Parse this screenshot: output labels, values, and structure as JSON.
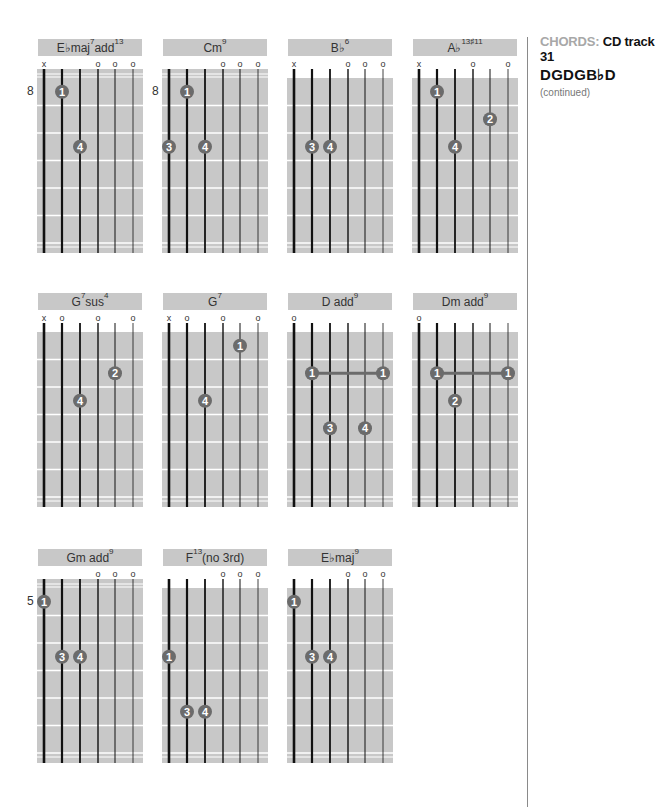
{
  "sidebar": {
    "category_label": "CHORDS:",
    "track_label": "CD track 31",
    "tuning": "DGDGB♭D",
    "note": "(continued)"
  },
  "colors": {
    "grid_bg": "#c8c8c8",
    "title_bg": "#c8c8c8",
    "finger_dot": "#6b6b6b",
    "barre": "#6b6b6b",
    "fret_line": "#ffffff",
    "string": "#111111"
  },
  "chords": [
    {
      "name": "E♭maj",
      "sup1": "7",
      "mid": "add",
      "sup2": "13",
      "x": 37,
      "y": 39,
      "open_top": false,
      "fret_number": "8",
      "marks": [
        "x",
        "",
        "",
        "o",
        "o",
        "o"
      ],
      "fingers": [
        {
          "string": 2,
          "fret": 1,
          "label": "1"
        },
        {
          "string": 3,
          "fret": 3,
          "label": "4"
        }
      ],
      "barre": null
    },
    {
      "name": "Cm",
      "sup1": "9",
      "mid": "",
      "sup2": "",
      "x": 162,
      "y": 39,
      "open_top": false,
      "fret_number": "8",
      "marks": [
        "",
        "",
        "",
        "o",
        "o",
        "o"
      ],
      "fingers": [
        {
          "string": 2,
          "fret": 1,
          "label": "1"
        },
        {
          "string": 1,
          "fret": 3,
          "label": "3"
        },
        {
          "string": 3,
          "fret": 3,
          "label": "4"
        }
      ],
      "barre": null
    },
    {
      "name": "B♭",
      "sup1": "6",
      "mid": "",
      "sup2": "",
      "x": 287,
      "y": 39,
      "open_top": true,
      "fret_number": "",
      "marks": [
        "x",
        "",
        "",
        "o",
        "o",
        "o"
      ],
      "fingers": [
        {
          "string": 2,
          "fret": 3,
          "label": "3"
        },
        {
          "string": 3,
          "fret": 3,
          "label": "4"
        }
      ],
      "barre": null
    },
    {
      "name": "A♭",
      "sup1": "13♯11",
      "mid": "",
      "sup2": "",
      "x": 412,
      "y": 39,
      "open_top": true,
      "fret_number": "",
      "marks": [
        "x",
        "",
        "",
        "o",
        "",
        "o"
      ],
      "fingers": [
        {
          "string": 2,
          "fret": 1,
          "label": "1"
        },
        {
          "string": 5,
          "fret": 2,
          "label": "2"
        },
        {
          "string": 3,
          "fret": 3,
          "label": "4"
        }
      ],
      "barre": null
    },
    {
      "name": "G",
      "sup1": "7",
      "mid": "sus",
      "sup2": "4",
      "x": 37,
      "y": 293,
      "open_top": true,
      "fret_number": "",
      "marks": [
        "x",
        "o",
        "",
        "o",
        "",
        "o"
      ],
      "fingers": [
        {
          "string": 5,
          "fret": 2,
          "label": "2"
        },
        {
          "string": 3,
          "fret": 3,
          "label": "4"
        }
      ],
      "barre": null
    },
    {
      "name": "G",
      "sup1": "7",
      "mid": "",
      "sup2": "",
      "x": 162,
      "y": 293,
      "open_top": true,
      "fret_number": "",
      "marks": [
        "x",
        "o",
        "",
        "o",
        "",
        "o"
      ],
      "fingers": [
        {
          "string": 5,
          "fret": 1,
          "label": "1"
        },
        {
          "string": 3,
          "fret": 3,
          "label": "4"
        }
      ],
      "barre": null
    },
    {
      "name": "D add",
      "sup1": "9",
      "mid": "",
      "sup2": "",
      "x": 287,
      "y": 293,
      "open_top": true,
      "fret_number": "",
      "marks": [
        "o",
        "",
        "",
        "",
        "",
        ""
      ],
      "fingers": [
        {
          "string": 3,
          "fret": 4,
          "label": "3"
        },
        {
          "string": 5,
          "fret": 4,
          "label": "4"
        }
      ],
      "barre": {
        "fret": 2,
        "from": 2,
        "to": 6,
        "label": "1"
      }
    },
    {
      "name": "Dm add",
      "sup1": "9",
      "mid": "",
      "sup2": "",
      "x": 412,
      "y": 293,
      "open_top": true,
      "fret_number": "",
      "marks": [
        "o",
        "",
        "",
        "",
        "",
        ""
      ],
      "fingers": [
        {
          "string": 3,
          "fret": 3,
          "label": "2"
        }
      ],
      "barre": {
        "fret": 2,
        "from": 2,
        "to": 6,
        "label": "1"
      }
    },
    {
      "name": "Gm add",
      "sup1": "9",
      "mid": "",
      "sup2": "",
      "x": 37,
      "y": 549,
      "open_top": false,
      "fret_number": "5",
      "marks": [
        "",
        "",
        "",
        "o",
        "o",
        "o"
      ],
      "fingers": [
        {
          "string": 1,
          "fret": 1,
          "label": "1"
        },
        {
          "string": 2,
          "fret": 3,
          "label": "3"
        },
        {
          "string": 3,
          "fret": 3,
          "label": "4"
        }
      ],
      "barre": null
    },
    {
      "name": "F",
      "sup1": "13",
      "mid": "(no 3rd)",
      "sup2": "",
      "x": 162,
      "y": 549,
      "open_top": true,
      "fret_number": "",
      "marks": [
        "",
        "",
        "",
        "o",
        "o",
        "o"
      ],
      "fingers": [
        {
          "string": 1,
          "fret": 3,
          "label": "1"
        },
        {
          "string": 2,
          "fret": 5,
          "label": "3"
        },
        {
          "string": 3,
          "fret": 5,
          "label": "4"
        }
      ],
      "barre": null
    },
    {
      "name": "E♭maj",
      "sup1": "9",
      "mid": "",
      "sup2": "",
      "x": 287,
      "y": 549,
      "open_top": true,
      "fret_number": "",
      "marks": [
        "",
        "",
        "",
        "o",
        "o",
        "o"
      ],
      "fingers": [
        {
          "string": 1,
          "fret": 1,
          "label": "1"
        },
        {
          "string": 2,
          "fret": 3,
          "label": "3"
        },
        {
          "string": 3,
          "fret": 3,
          "label": "4"
        }
      ],
      "barre": null
    }
  ]
}
